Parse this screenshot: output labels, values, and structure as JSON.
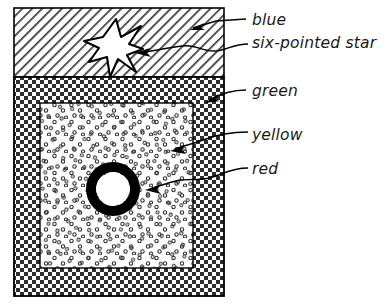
{
  "figure": {
    "type": "hand-drawn-region-diagram",
    "background_color": "#ffffff",
    "ink_color": "#000000",
    "width": 384,
    "height": 308
  },
  "regions": [
    {
      "id": "blue-region",
      "label": "blue",
      "fill_style": "diagonal-hatch",
      "hatch_angle_deg": 45,
      "hatch_spacing_px": 7,
      "rect": {
        "x": 14,
        "y": 8,
        "width": 210,
        "height": 69
      }
    },
    {
      "id": "green-region",
      "label": "green",
      "fill_style": "checkerboard",
      "checker_size_px": 4,
      "rect": {
        "x": 14,
        "y": 77,
        "width": 210,
        "height": 219
      }
    },
    {
      "id": "yellow-region",
      "label": "yellow",
      "fill_style": "stipple-circles",
      "stipple_radius_px": 1.6,
      "rect": {
        "x": 40,
        "y": 103,
        "width": 153,
        "height": 165
      }
    },
    {
      "id": "red-region",
      "label": "red",
      "fill_style": "solid-ring",
      "shape": "annulus",
      "center": {
        "x": 113,
        "y": 189
      },
      "outer_radius_px": 27,
      "inner_radius_px": 17
    }
  ],
  "shapes": [
    {
      "id": "six-pointed-star",
      "label": "six-pointed star",
      "points": 6,
      "fill": "#ffffff",
      "stroke": "#000000",
      "center": {
        "x": 115,
        "y": 46
      },
      "outer_radius_px": 27,
      "inner_radius_px": 11
    }
  ],
  "labels": [
    {
      "id": "label-blue",
      "text": "blue",
      "x": 252,
      "y": 25
    },
    {
      "id": "label-star",
      "text": "six-pointed star",
      "x": 252,
      "y": 48
    },
    {
      "id": "label-green",
      "text": "green",
      "x": 252,
      "y": 96
    },
    {
      "id": "label-yellow",
      "text": "yellow",
      "x": 252,
      "y": 140
    },
    {
      "id": "label-red",
      "text": "red",
      "x": 252,
      "y": 174
    }
  ],
  "leaders": [
    {
      "id": "leader-blue",
      "target_region": "blue-region",
      "path": "M 246 19 L 216 21 L 193 28",
      "arrow_tip": {
        "x": 191,
        "y": 29
      },
      "arrow_angle_deg": 196
    },
    {
      "id": "leader-star",
      "target_region": "six-pointed-star",
      "path": "M 248 44 C 232 44 226 51 214 51 C 200 51 196 44 182 46 C 166 48 152 51 139 53",
      "arrow_tip": {
        "x": 136,
        "y": 53
      },
      "arrow_angle_deg": 188
    },
    {
      "id": "leader-green",
      "target_region": "green-region",
      "path": "M 246 90 C 234 90 222 93 209 100",
      "arrow_tip": {
        "x": 206,
        "y": 102
      },
      "arrow_angle_deg": 205
    },
    {
      "id": "leader-yellow",
      "target_region": "yellow-region",
      "path": "M 248 132 C 230 132 216 135 203 140 C 190 145 182 146 175 149",
      "arrow_tip": {
        "x": 171,
        "y": 150
      },
      "arrow_angle_deg": 196
    },
    {
      "id": "leader-red",
      "target_region": "red-region",
      "path": "M 248 168 C 230 168 222 175 209 178 C 196 181 188 178 176 181 C 164 184 156 187 150 189",
      "arrow_tip": {
        "x": 146,
        "y": 190
      },
      "arrow_angle_deg": 189
    }
  ]
}
